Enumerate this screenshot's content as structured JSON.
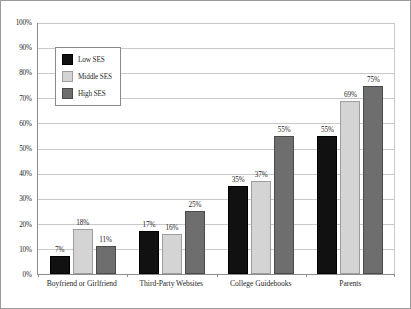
{
  "chart_data": {
    "type": "bar",
    "title": "",
    "xlabel": "",
    "ylabel": "",
    "ylim": [
      0,
      100
    ],
    "ytick_labels": [
      "100%",
      "90%",
      "80%",
      "70%",
      "60%",
      "50%",
      "40%",
      "30%",
      "20%",
      "10%",
      "0%"
    ],
    "ytick_values": [
      100,
      90,
      80,
      70,
      60,
      50,
      40,
      30,
      20,
      10,
      0
    ],
    "grid": true,
    "legend_position": "upper-left-inside",
    "categories": [
      "Boyfriend or Girlfriend",
      "Third-Party Websites",
      "College Guidebooks",
      "Parents"
    ],
    "series": [
      {
        "name": "Low SES",
        "color": "#111111",
        "values": [
          7,
          17,
          35,
          55
        ],
        "labels": [
          "7%",
          "17%",
          "35%",
          "55%"
        ]
      },
      {
        "name": "Middle SES",
        "color": "#d4d4d4",
        "values": [
          18,
          16,
          37,
          69
        ],
        "labels": [
          "18%",
          "16%",
          "37%",
          "69%"
        ]
      },
      {
        "name": "High SES",
        "color": "#6e6e6e",
        "values": [
          11,
          25,
          55,
          75
        ],
        "labels": [
          "11%",
          "25%",
          "55%",
          "75%"
        ]
      }
    ]
  }
}
